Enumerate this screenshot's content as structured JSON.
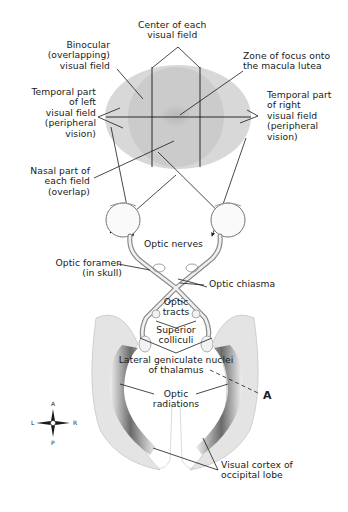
{
  "figure": {
    "colors": {
      "outer_field": "#d6d6d6",
      "binocular_field": "#c9c9c9",
      "macula_zone": "#bdbdbd",
      "lines": "#1a1a1a",
      "tissue": "#e8e8e8",
      "tissue_dark": "#7a7a7a",
      "background": "#ffffff"
    },
    "labels": {
      "center_of_field": "Center of each\nvisual field",
      "binocular": "Binocular\n(overlapping)\nvisual field",
      "zone_focus": "Zone of focus onto\nthe macula lutea",
      "temporal_left": "Temporal part\nof left\nvisual field\n(peripheral\nvision)",
      "temporal_right": "Temporal part\nof right\nvisual field\n(peripheral\nvision)",
      "nasal": "Nasal part of\neach field\n(overlap)",
      "optic_nerves": "Optic nerves",
      "optic_foramen": "Optic foramen\n(in skull)",
      "optic_chiasma": "Optic chiasma",
      "optic_tracts": "Optic\ntracts",
      "superior_colliculi": "Superior\ncolliculi",
      "lateral_geniculate": "Lateral geniculate nuclei\nof thalamus",
      "optic_radiations": "Optic\nradiations",
      "visual_cortex": "Visual cortex of\noccipital lobe",
      "marker_a": "A"
    },
    "compass": {
      "anterior": "A",
      "posterior": "P",
      "left": "L",
      "right": "R"
    }
  }
}
